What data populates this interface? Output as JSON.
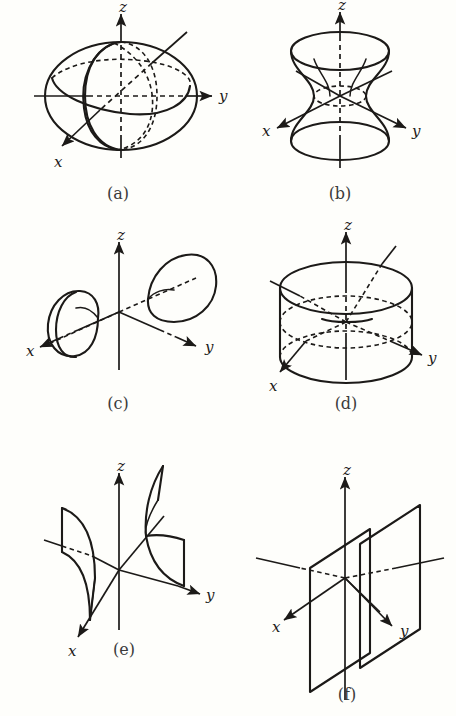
{
  "figure": {
    "background_color": "#fefefb",
    "ink_color": "#1c1a18",
    "panel_count": 6,
    "axis_labels": {
      "x": "x",
      "y": "y",
      "z": "z"
    }
  },
  "panels": [
    {
      "id": "a",
      "caption": "(a)",
      "surface": "ellipsoid",
      "axes": [
        "x",
        "y",
        "z"
      ],
      "label_x": "x",
      "label_y": "y",
      "label_z": "z"
    },
    {
      "id": "b",
      "caption": "(b)",
      "surface": "hyperboloid-of-one-sheet",
      "axes": [
        "x",
        "y",
        "z"
      ],
      "label_x": "x",
      "label_y": "y",
      "label_z": "z"
    },
    {
      "id": "c",
      "caption": "(c)",
      "surface": "hyperboloid-of-two-sheets",
      "axes": [
        "x",
        "y",
        "z"
      ],
      "label_x": "x",
      "label_y": "y",
      "label_z": "z"
    },
    {
      "id": "d",
      "caption": "(d)",
      "surface": "elliptic-cylinder",
      "axes": [
        "x",
        "y",
        "z"
      ],
      "label_x": "x",
      "label_y": "y",
      "label_z": "z"
    },
    {
      "id": "e",
      "caption": "(e)",
      "surface": "hyperbolic-cylinder",
      "axes": [
        "x",
        "y",
        "z"
      ],
      "label_x": "x",
      "label_y": "y",
      "label_z": "z"
    },
    {
      "id": "f",
      "caption": "(f)",
      "surface": "pair-of-parallel-planes",
      "axes": [
        "x",
        "y",
        "z"
      ],
      "label_x": "x",
      "label_y": "y",
      "label_z": "z"
    }
  ]
}
